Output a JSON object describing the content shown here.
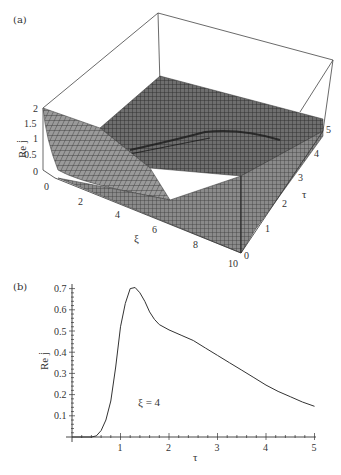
{
  "panels": {
    "a": {
      "label": "(a)"
    },
    "b": {
      "label": "(b)"
    }
  },
  "chart_data": [
    {
      "panel": "(a)",
      "type": "surface3d",
      "title": "",
      "xlabel": "ξ",
      "ylabel": "τ",
      "zlabel": "Re j̇",
      "x_ticks": [
        "2",
        "4",
        "6",
        "8",
        "10"
      ],
      "x_range": [
        0,
        10
      ],
      "y_ticks": [
        "0",
        "1",
        "2",
        "3",
        "4",
        "5"
      ],
      "y_range": [
        0,
        5
      ],
      "z_ticks": [
        "0",
        "0.5",
        "1",
        "1.5",
        "2"
      ],
      "z_range": [
        0,
        2
      ],
      "origin_label": "0",
      "description": "Mesh surface: Re j̇ ≈ 2 at ξ=0 decaying rapidly to ~0 by ξ≈2; plateau region with wave front ridge propagating in ξ as τ increases"
    },
    {
      "panel": "(b)",
      "type": "line",
      "title": "",
      "xlabel": "τ",
      "ylabel": "Re j̇",
      "annotation": "ξ = 4",
      "x_ticks": [
        "1",
        "2",
        "3",
        "4",
        "5"
      ],
      "y_ticks": [
        "0.1",
        "0.2",
        "0.3",
        "0.4",
        "0.5",
        "0.6",
        "0.7"
      ],
      "xlim": [
        0,
        5.2
      ],
      "ylim": [
        0,
        0.72
      ],
      "grid": false,
      "series": [
        {
          "name": "ξ = 4",
          "x": [
            0.0,
            0.4,
            0.5,
            0.6,
            0.7,
            0.8,
            0.9,
            1.0,
            1.1,
            1.2,
            1.3,
            1.4,
            1.5,
            1.6,
            1.7,
            1.8,
            2.0,
            2.25,
            2.5,
            2.75,
            3.0,
            3.25,
            3.5,
            3.75,
            4.0,
            4.25,
            4.5,
            4.75,
            5.0
          ],
          "y": [
            0.0,
            0.0,
            0.005,
            0.03,
            0.08,
            0.17,
            0.33,
            0.52,
            0.63,
            0.7,
            0.705,
            0.68,
            0.64,
            0.59,
            0.555,
            0.53,
            0.505,
            0.48,
            0.455,
            0.42,
            0.385,
            0.35,
            0.315,
            0.28,
            0.245,
            0.215,
            0.19,
            0.165,
            0.145
          ]
        }
      ]
    }
  ]
}
